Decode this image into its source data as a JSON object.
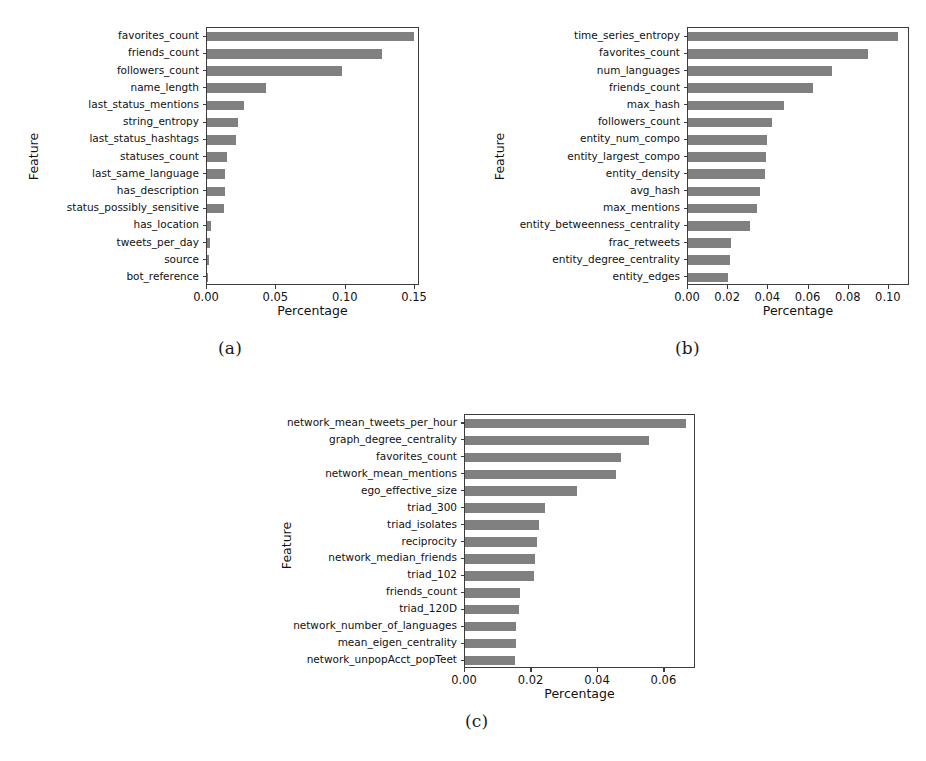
{
  "figure": {
    "background": "#ffffff",
    "bar_color": "#808080",
    "axis_color": "#3c3c3c",
    "width": 926,
    "height": 761
  },
  "panels": [
    {
      "caption": "(a)",
      "chart_data": {
        "type": "bar",
        "orientation": "horizontal",
        "title": "",
        "xlabel": "Percentage",
        "ylabel": "Feature",
        "xlim": [
          0.0,
          0.1535
        ],
        "xticks": [
          0.0,
          0.05,
          0.1,
          0.15
        ],
        "xticklabels": [
          "0.00",
          "0.05",
          "0.10",
          "0.15"
        ],
        "grid": false,
        "legend": "none",
        "categories": [
          "favorites_count",
          "friends_count",
          "followers_count",
          "name_length",
          "last_status_mentions",
          "string_entropy",
          "last_status_hashtags",
          "statuses_count",
          "last_same_language",
          "has_description",
          "status_possibly_sensitive",
          "has_location",
          "tweets_per_day",
          "source",
          "bot_reference"
        ],
        "values": [
          0.1492,
          0.1264,
          0.0972,
          0.0423,
          0.0268,
          0.0225,
          0.0211,
          0.0141,
          0.0127,
          0.0127,
          0.012,
          0.0028,
          0.0021,
          0.0014,
          0.0007
        ]
      }
    },
    {
      "caption": "(b)",
      "chart_data": {
        "type": "bar",
        "orientation": "horizontal",
        "title": "",
        "xlabel": "Percentage",
        "ylabel": "Feature",
        "xlim": [
          0.0,
          0.1105
        ],
        "xticks": [
          0.0,
          0.02,
          0.04,
          0.06,
          0.08,
          0.1
        ],
        "xticklabels": [
          "0.00",
          "0.02",
          "0.04",
          "0.06",
          "0.08",
          "0.10"
        ],
        "grid": false,
        "legend": "none",
        "categories": [
          "time_series_entropy",
          "favorites_count",
          "num_languages",
          "friends_count",
          "max_hash",
          "followers_count",
          "entity_num_compo",
          "entity_largest_compo",
          "entity_density",
          "avg_hash",
          "max_mentions",
          "entity_betweenness_centrality",
          "frac_retweets",
          "entity_degree_centrality",
          "entity_edges"
        ],
        "values": [
          0.1046,
          0.0896,
          0.0716,
          0.0621,
          0.0477,
          0.0416,
          0.0391,
          0.0386,
          0.0382,
          0.0356,
          0.0341,
          0.0311,
          0.0213,
          0.0208,
          0.0201
        ]
      }
    },
    {
      "caption": "(c)",
      "chart_data": {
        "type": "bar",
        "orientation": "horizontal",
        "title": "",
        "xlabel": "Percentage",
        "ylabel": "Feature",
        "xlim": [
          0.0,
          0.0695
        ],
        "xticks": [
          0.0,
          0.02,
          0.04,
          0.06
        ],
        "xticklabels": [
          "0.00",
          "0.02",
          "0.04",
          "0.06"
        ],
        "grid": false,
        "legend": "none",
        "categories": [
          "network_mean_tweets_per_hour",
          "graph_degree_centrality",
          "favorites_count",
          "network_mean_mentions",
          "ego_effective_size",
          "triad_300",
          "triad_isolates",
          "reciprocity",
          "network_median_friends",
          "triad_102",
          "friends_count",
          "triad_120D",
          "network_number_of_languages",
          "mean_eigen_centrality",
          "network_unpopAcct_popTeet"
        ],
        "values": [
          0.0664,
          0.0554,
          0.0468,
          0.0453,
          0.0338,
          0.0242,
          0.0224,
          0.0218,
          0.021,
          0.0208,
          0.0164,
          0.0161,
          0.0154,
          0.0152,
          0.0151
        ]
      }
    }
  ]
}
